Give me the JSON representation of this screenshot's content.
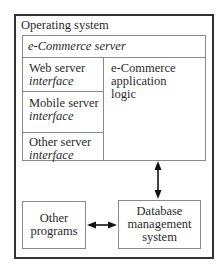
{
  "diagram": {
    "operating_system": {
      "label": "Operating system"
    },
    "ecommerce_server": {
      "label": "e-Commerce server",
      "interfaces": [
        {
          "name": "Web server",
          "kind": "interface"
        },
        {
          "name": "Mobile server",
          "kind": "interface"
        },
        {
          "name": "Other server",
          "kind": "interface"
        }
      ],
      "application_logic": {
        "line1": "e-Commerce",
        "line2": "application",
        "line3": "logic"
      }
    },
    "other_programs": {
      "line1": "Other",
      "line2": "programs"
    },
    "dbms": {
      "line1": "Database",
      "line2": "management",
      "line3": "system"
    },
    "connections": [
      {
        "from": "e-Commerce server",
        "to": "Database management system",
        "type": "bidirectional-arrow"
      },
      {
        "from": "Other programs",
        "to": "Database management system",
        "type": "bidirectional-arrow"
      }
    ],
    "colors": {
      "outer_border": "#333333",
      "inner_border": "#8a8a8a",
      "text": "#2a2a2a",
      "arrow": "#111111"
    }
  }
}
